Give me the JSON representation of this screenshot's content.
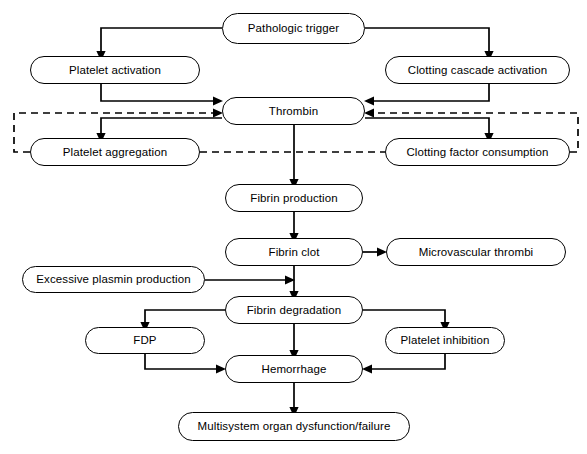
{
  "diagram": {
    "width": 587,
    "height": 454,
    "background_color": "#ffffff",
    "line_color": "#000000",
    "text_color": "#000000"
  },
  "nodes": [
    {
      "id": "pathologic_trigger",
      "label": "Pathologic trigger",
      "x": 222,
      "y": 13,
      "w": 143,
      "h": 31,
      "font_size": 11.5
    },
    {
      "id": "platelet_activation",
      "label": "Platelet activation",
      "x": 30,
      "y": 56,
      "w": 170,
      "h": 28,
      "font_size": 11.5
    },
    {
      "id": "clotting_cascade",
      "label": "Clotting cascade activation",
      "x": 385,
      "y": 56,
      "w": 185,
      "h": 28,
      "font_size": 11.5
    },
    {
      "id": "thrombin",
      "label": "Thrombin",
      "x": 222,
      "y": 97,
      "w": 143,
      "h": 28,
      "font_size": 11.5
    },
    {
      "id": "platelet_aggregation",
      "label": "Platelet aggregation",
      "x": 30,
      "y": 138,
      "w": 170,
      "h": 28,
      "font_size": 11.5
    },
    {
      "id": "clotting_factor_consumption",
      "label": "Clotting factor consumption",
      "x": 385,
      "y": 138,
      "w": 185,
      "h": 28,
      "font_size": 11.5
    },
    {
      "id": "fibrin_production",
      "label": "Fibrin production",
      "x": 225,
      "y": 184,
      "w": 138,
      "h": 28,
      "font_size": 11.5
    },
    {
      "id": "fibrin_clot",
      "label": "Fibrin clot",
      "x": 225,
      "y": 238,
      "w": 138,
      "h": 28,
      "font_size": 11.5
    },
    {
      "id": "microvascular_thrombi",
      "label": "Microvascular thrombi",
      "x": 386,
      "y": 238,
      "w": 180,
      "h": 28,
      "font_size": 11.5
    },
    {
      "id": "excessive_plasmin",
      "label": "Excessive plasmin production",
      "x": 22,
      "y": 266,
      "w": 183,
      "h": 27,
      "font_size": 11.5
    },
    {
      "id": "fibrin_degradation",
      "label": "Fibrin degradation",
      "x": 225,
      "y": 296,
      "w": 138,
      "h": 28,
      "font_size": 11.5
    },
    {
      "id": "fdp",
      "label": "FDP",
      "x": 85,
      "y": 327,
      "w": 120,
      "h": 27,
      "font_size": 11.5
    },
    {
      "id": "platelet_inhibition",
      "label": "Platelet inhibition",
      "x": 385,
      "y": 327,
      "w": 120,
      "h": 27,
      "font_size": 11.5
    },
    {
      "id": "hemorrhage",
      "label": "Hemorrhage",
      "x": 225,
      "y": 355,
      "w": 138,
      "h": 28,
      "font_size": 11.5
    },
    {
      "id": "mods",
      "label": "Multisystem organ dysfunction/failure",
      "x": 178,
      "y": 412,
      "w": 232,
      "h": 29,
      "font_size": 11.5
    }
  ],
  "edges": [
    {
      "id": "trigger-to-platelet-activation",
      "from": "pathologic_trigger",
      "to": "platelet_activation",
      "style": "solid",
      "path": "M 222 28 L 101 28 L 101 52",
      "arrow": "down"
    },
    {
      "id": "trigger-to-clotting-cascade",
      "from": "pathologic_trigger",
      "to": "clotting_cascade",
      "style": "solid",
      "path": "M 365 28 L 489 28 L 489 52",
      "arrow": "down"
    },
    {
      "id": "platelet-activation-to-thrombin",
      "from": "platelet_activation",
      "to": "thrombin",
      "style": "solid",
      "path": "M 101 84 L 101 101 L 214 101",
      "arrow": "right"
    },
    {
      "id": "clotting-cascade-to-thrombin",
      "from": "clotting_cascade",
      "to": "thrombin",
      "style": "solid",
      "path": "M 489 84 L 489 101 L 373 101",
      "arrow": "left"
    },
    {
      "id": "platelet-aggregation-feedback-to-thrombin",
      "from": "platelet_aggregation",
      "to": "thrombin",
      "style": "dashed",
      "path": "M 30 152 L 14 152 L 14 113 L 214 113",
      "arrow": "right"
    },
    {
      "id": "clotting-factor-feedback-to-thrombin",
      "from": "clotting_factor_consumption",
      "to": "thrombin",
      "style": "dashed",
      "path": "M 570 152 L 578 152 L 578 113 L 373 113",
      "arrow": "left"
    },
    {
      "id": "thrombin-to-platelet-aggregation",
      "from": "thrombin",
      "to": "platelet_aggregation",
      "style": "solid",
      "path": "M 222 118 L 101 118 L 101 134",
      "arrow": "down"
    },
    {
      "id": "thrombin-to-clotting-factor-consumption",
      "from": "thrombin",
      "to": "clotting_factor_consumption",
      "style": "solid",
      "path": "M 365 118 L 489 118 L 489 134",
      "arrow": "down"
    },
    {
      "id": "platelet-aggregation-to-clotting-factor",
      "from": "platelet_aggregation",
      "to": "clotting_factor_consumption",
      "style": "dashed",
      "path": "M 200 152 L 385 152",
      "arrow": "none"
    },
    {
      "id": "thrombin-to-fibrin-production",
      "from": "thrombin",
      "to": "fibrin_production",
      "style": "solid",
      "path": "M 294 125 L 294 180",
      "arrow": "down"
    },
    {
      "id": "fibrin-production-to-fibrin-clot",
      "from": "fibrin_production",
      "to": "fibrin_clot",
      "style": "solid",
      "path": "M 294 212 L 294 234",
      "arrow": "down"
    },
    {
      "id": "fibrin-clot-to-microvascular-thrombi",
      "from": "fibrin_clot",
      "to": "microvascular_thrombi",
      "style": "solid",
      "path": "M 363 252 L 378 252",
      "arrow": "right"
    },
    {
      "id": "fibrin-clot-to-fibrin-degradation",
      "from": "fibrin_clot",
      "to": "fibrin_degradation",
      "style": "solid",
      "path": "M 294 266 L 294 292",
      "arrow": "down"
    },
    {
      "id": "excessive-plasmin-to-fibrin-degradation",
      "from": "excessive_plasmin",
      "to": "fibrin_degradation",
      "style": "solid",
      "path": "M 205 280 L 286 280",
      "arrow": "right"
    },
    {
      "id": "fibrin-degradation-to-fdp",
      "from": "fibrin_degradation",
      "to": "fdp",
      "style": "solid",
      "path": "M 225 310 L 145 310 L 145 323",
      "arrow": "down"
    },
    {
      "id": "fibrin-degradation-to-platelet-inhibition",
      "from": "fibrin_degradation",
      "to": "platelet_inhibition",
      "style": "solid",
      "path": "M 363 310 L 445 310 L 445 323",
      "arrow": "down"
    },
    {
      "id": "fibrin-degradation-to-hemorrhage",
      "from": "fibrin_degradation",
      "to": "hemorrhage",
      "style": "solid",
      "path": "M 294 324 L 294 351",
      "arrow": "down"
    },
    {
      "id": "fdp-to-hemorrhage",
      "from": "fdp",
      "to": "hemorrhage",
      "style": "solid",
      "path": "M 145 354 L 145 369 L 217 369",
      "arrow": "right"
    },
    {
      "id": "platelet-inhibition-to-hemorrhage",
      "from": "platelet_inhibition",
      "to": "hemorrhage",
      "style": "solid",
      "path": "M 445 354 L 445 369 L 371 369",
      "arrow": "left"
    },
    {
      "id": "hemorrhage-to-mods",
      "from": "hemorrhage",
      "to": "mods",
      "style": "solid",
      "path": "M 294 383 L 294 408",
      "arrow": "down"
    }
  ]
}
